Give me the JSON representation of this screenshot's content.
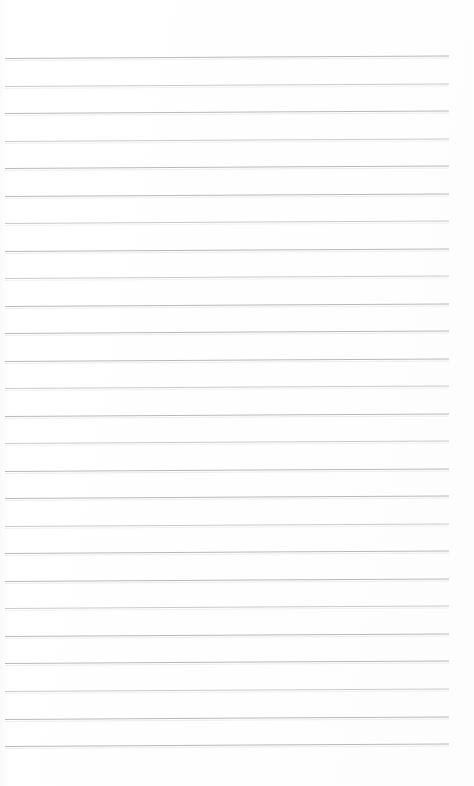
{
  "document": {
    "kind": "lined-paper-scan",
    "title": "Blank ruled notepad page",
    "body_text": "",
    "visible_text_content": "",
    "page_width_px": 474,
    "page_height_px": 786,
    "background_color": "#ffffff",
    "rule_color": "#b4b6b9",
    "rule_color_soft": "#c6c8cb",
    "rule_thickness_px": 1,
    "rule_count": 26,
    "rule_spacing_px": 27.5,
    "first_rule_y_px": 58,
    "last_rule_y_px": 746,
    "rule_left_x_px": 5,
    "rule_right_x_px": 449,
    "rule_tilt_deg": -0.33,
    "top_margin_px": 58,
    "bottom_margin_px": 40
  },
  "rules": [
    {
      "index": 1,
      "y": 58,
      "tone": "normal"
    },
    {
      "index": 2,
      "y": 85.5,
      "tone": "soft"
    },
    {
      "index": 3,
      "y": 113,
      "tone": "normal"
    },
    {
      "index": 4,
      "y": 140.5,
      "tone": "soft"
    },
    {
      "index": 5,
      "y": 168,
      "tone": "normal"
    },
    {
      "index": 6,
      "y": 195.5,
      "tone": "normal"
    },
    {
      "index": 7,
      "y": 223,
      "tone": "soft"
    },
    {
      "index": 8,
      "y": 250.5,
      "tone": "normal"
    },
    {
      "index": 9,
      "y": 278,
      "tone": "soft"
    },
    {
      "index": 10,
      "y": 305.5,
      "tone": "normal"
    },
    {
      "index": 11,
      "y": 333,
      "tone": "normal"
    },
    {
      "index": 12,
      "y": 360.5,
      "tone": "normal"
    },
    {
      "index": 13,
      "y": 388,
      "tone": "soft"
    },
    {
      "index": 14,
      "y": 415.5,
      "tone": "normal"
    },
    {
      "index": 15,
      "y": 443,
      "tone": "soft"
    },
    {
      "index": 16,
      "y": 470.5,
      "tone": "normal"
    },
    {
      "index": 17,
      "y": 498,
      "tone": "normal"
    },
    {
      "index": 18,
      "y": 525.5,
      "tone": "soft"
    },
    {
      "index": 19,
      "y": 553,
      "tone": "normal"
    },
    {
      "index": 20,
      "y": 580.5,
      "tone": "normal"
    },
    {
      "index": 21,
      "y": 608,
      "tone": "soft"
    },
    {
      "index": 22,
      "y": 635.5,
      "tone": "normal"
    },
    {
      "index": 23,
      "y": 663,
      "tone": "normal"
    },
    {
      "index": 24,
      "y": 691,
      "tone": "soft"
    },
    {
      "index": 25,
      "y": 718.5,
      "tone": "normal"
    },
    {
      "index": 26,
      "y": 746,
      "tone": "normal"
    }
  ]
}
